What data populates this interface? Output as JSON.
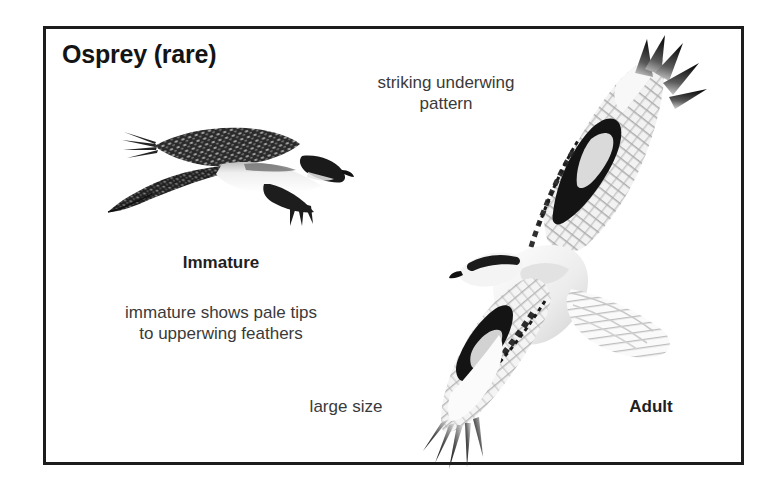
{
  "plate": {
    "title": "Osprey (rare)",
    "border_color": "#1c1c1c",
    "background_color": "#ffffff"
  },
  "labels": {
    "underwing": "striking underwing\npattern",
    "immature": "Immature",
    "immature_note": "immature shows pale tips\nto upperwing feathers",
    "large_size": "large size",
    "adult": "Adult"
  },
  "figures": {
    "immature": {
      "name": "immature-osprey-illustration",
      "pose": "side profile in flight, facing right",
      "description": "dark mottled upperwings with pale feather tips, white underbody, dark carpal and head"
    },
    "adult": {
      "name": "adult-osprey-illustration",
      "pose": "underside in flight, banking, facing left",
      "description": "white underbody, black carpal patches, black primary fingers, barred underwing coverts, fanned tail"
    }
  }
}
